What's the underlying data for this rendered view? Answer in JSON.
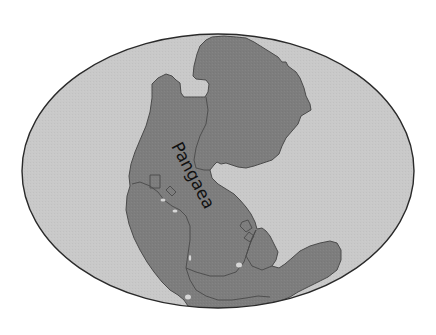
{
  "map": {
    "projection": "mollweide-style ellipse",
    "label": "Pangaea",
    "colors": {
      "background": "#ffffff",
      "ocean": "#c9c9c9",
      "land": "#7d7d7d",
      "coastline": "#4a4a4a",
      "outline": "#2a2a2a",
      "label": "#111111"
    },
    "features": [
      {
        "name": "Pangaea",
        "type": "supercontinent"
      }
    ]
  }
}
